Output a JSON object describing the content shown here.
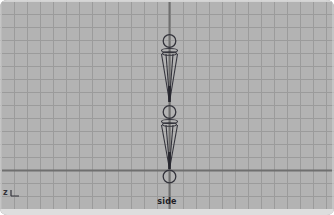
{
  "viewport": {
    "camera_label": "side",
    "axis_indicator": {
      "letter": "z"
    },
    "grid_spacing_px": 13,
    "colors": {
      "background": "#b3b3b3",
      "grid_line": "#9b9b9b",
      "axis_line": "#6f6f6f",
      "skeleton": "#34343c",
      "skeleton_dark": "#26262e",
      "label_text": "#202026",
      "bottom_strip": "#dedede"
    }
  },
  "scene": {
    "axes": {
      "vertical_x": 169.5,
      "horizontal_y": 170.5,
      "top": 2,
      "bottom": 209,
      "left": 2,
      "right": 332
    },
    "skeleton": {
      "joints": [
        {
          "name": "joint-top",
          "cx": 169.5,
          "cy": 41,
          "r": 6.3
        },
        {
          "name": "joint-middle",
          "cx": 169.5,
          "cy": 112,
          "r": 6.3
        },
        {
          "name": "joint-root",
          "cx": 169.5,
          "cy": 176.5,
          "r": 6.3
        }
      ],
      "bones": [
        {
          "name": "bone-upper",
          "cx": 169.5,
          "ring1Y": 50.5,
          "ring2Y": 53.5,
          "baseRx": 8,
          "innerRx": 3.5,
          "startY": 54,
          "tipY": 102,
          "darkFromY": 86
        },
        {
          "name": "bone-lower",
          "cx": 169.5,
          "ring1Y": 121.5,
          "ring2Y": 124.5,
          "baseRx": 8,
          "innerRx": 3.5,
          "startY": 125,
          "tipY": 169,
          "darkFromY": 152
        }
      ]
    }
  }
}
